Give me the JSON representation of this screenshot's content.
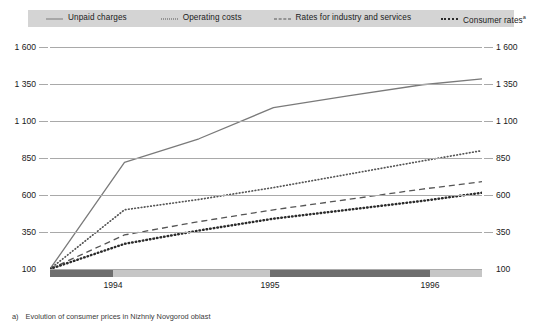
{
  "legend": {
    "items": [
      {
        "label": "Unpaid charges",
        "style": "solid",
        "color": "#7a7a7a",
        "icon": "line-solid-icon"
      },
      {
        "label": "Operating costs",
        "style": "dotted",
        "color": "#555555",
        "icon": "line-dotted-icon"
      },
      {
        "label": "Rates for industry and services",
        "style": "dashed",
        "color": "#555555",
        "icon": "line-dashed-icon"
      },
      {
        "label": "Consumer rates",
        "style": "bold-dotted",
        "color": "#2b2b2b",
        "icon": "line-bold-dotted-icon",
        "superscript": "a"
      }
    ],
    "background": "#d4d4d4"
  },
  "axes": {
    "y_ticks_left": [
      "1 600",
      "1 350",
      "1 100",
      "850",
      "600",
      "350",
      "100"
    ],
    "y_ticks_right": [
      "1 600",
      "1 350",
      "1 100",
      "850",
      "600",
      "350",
      "100"
    ],
    "x_ticks": [
      "1994",
      "1995",
      "1996"
    ]
  },
  "footnote": {
    "marker": "a)",
    "text": "Evolution of consumer prices in Nizhniy Novgorod oblast"
  },
  "chart_data": {
    "type": "line",
    "title": "",
    "subtitle": "",
    "xlabel": "",
    "ylabel": "",
    "ylim": [
      100,
      1600
    ],
    "yticks": [
      100,
      350,
      600,
      850,
      1100,
      1350,
      1600
    ],
    "grid": true,
    "legend_position": "top",
    "x": [
      1993.5,
      1994,
      1994.5,
      1995,
      1995.5,
      1996,
      1996.4
    ],
    "xtick_labels": [
      "1994",
      "1995",
      "1996"
    ],
    "xtick_positions": [
      1994,
      1995,
      1996
    ],
    "series": [
      {
        "name": "Unpaid charges",
        "style": "solid",
        "color": "#7a7a7a",
        "values": [
          100,
          820,
          980,
          1190,
          1270,
          1345,
          1385
        ]
      },
      {
        "name": "Operating costs",
        "style": "dotted",
        "color": "#555555",
        "values": [
          100,
          500,
          570,
          650,
          740,
          830,
          900
        ]
      },
      {
        "name": "Rates for industry and services",
        "style": "dashed",
        "color": "#555555",
        "values": [
          100,
          330,
          420,
          500,
          570,
          640,
          690
        ]
      },
      {
        "name": "Consumer rates",
        "style": "bold-dotted",
        "color": "#2b2b2b",
        "values": [
          100,
          270,
          360,
          440,
          500,
          560,
          615
        ]
      }
    ]
  }
}
